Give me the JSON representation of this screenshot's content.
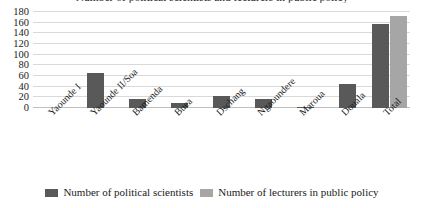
{
  "chart_data": {
    "type": "bar",
    "title": "Number of political scientists and lecturers in public policy",
    "xlabel": "",
    "ylabel": "",
    "ylim": [
      0,
      180
    ],
    "yticks": [
      0,
      20,
      40,
      60,
      80,
      100,
      120,
      140,
      160,
      180
    ],
    "ytick_labels": [
      "0",
      "20",
      "40",
      "60",
      "80",
      "100",
      "120",
      "140",
      "160",
      "180"
    ],
    "grid": true,
    "legend_position": "bottom",
    "categories": [
      "Yaounde I",
      "Yaounde II/Soa",
      "Bamenda",
      "Buea",
      "Dschang",
      "Ngaoundere",
      "Maroua",
      "Douala",
      "Total"
    ],
    "series": [
      {
        "name": "Number of political scientists",
        "color": "#595959",
        "values": [
          0,
          65,
          16,
          10,
          22,
          16,
          2,
          45,
          157
        ]
      },
      {
        "name": "Number of lecturers in public policy",
        "color": "#a6a6a6",
        "values": [
          0,
          0,
          0,
          0,
          0,
          0,
          0,
          0,
          172
        ]
      }
    ]
  },
  "colors": {
    "series_1": "#595959",
    "series_2": "#a6a6a6",
    "gridline": "#d9d9d9",
    "axis": "#bfbfbf",
    "background": "#ffffff"
  }
}
